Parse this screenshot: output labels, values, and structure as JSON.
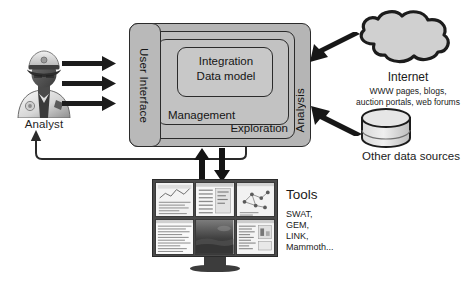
{
  "diagram": {
    "palette": {
      "outline": "#2b2b2b",
      "layer_analysis": "#b5b5b5",
      "layer_exploration": "#bdbdbd",
      "layer_management": "#c2c2c2",
      "layer_integration": "#c8c8c8",
      "background": "#ffffff",
      "monitor_frame": "#4a4a4a"
    }
  },
  "analyst": {
    "label": "Analyst",
    "icon": "analyst-officer-avatar-icon",
    "arrow_count": 3,
    "arrows_icon": "arrow-right-icon",
    "feedback_icon": "feedback-loop-arrow-icon"
  },
  "system": {
    "layers": {
      "user_interface": "User Interface",
      "analysis": "Analysis",
      "exploration": "Exploration",
      "management": "Management",
      "integration_line1": "Integration",
      "integration_line2": "Data model",
      "integration_full": "Integration Data model"
    }
  },
  "internet": {
    "icon": "cloud-icon",
    "title": "Internet",
    "desc_line1": "WWW pages, blogs,",
    "desc_line2": "auction portals, web forums",
    "arrow_icon": "arrow-left-icon"
  },
  "data_sources": {
    "icon": "database-cylinder-icon",
    "label": "Other data sources",
    "arrow_icon": "arrow-upleft-icon"
  },
  "tools": {
    "title": "Tools",
    "items": [
      "SWAT,",
      "GEM,",
      "LINK,",
      "Mammoth..."
    ],
    "monitor_icon": "multi-screen-monitor-icon",
    "arrow_up_icon": "arrow-up-icon",
    "arrow_down_icon": "arrow-down-icon",
    "screens": [
      "chart-screenshot-tile",
      "table-screenshot-tile",
      "network-graph-screenshot-tile",
      "spreadsheet-screenshot-tile",
      "image-view-screenshot-tile",
      "list-panel-screenshot-tile"
    ]
  }
}
